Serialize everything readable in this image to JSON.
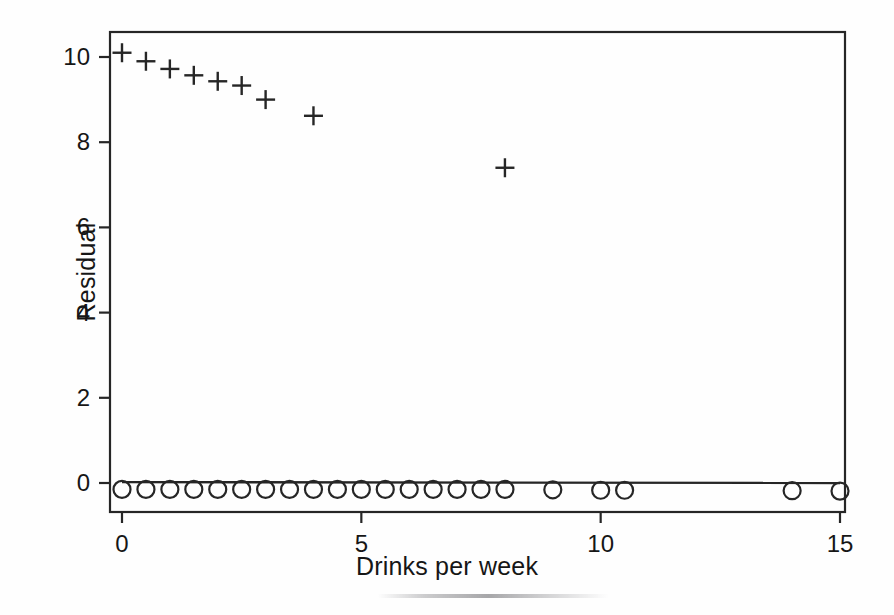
{
  "figure": {
    "background": "#fefefe",
    "ink_color": "#1a1a1a"
  },
  "axes": {
    "x_title": "Drinks per week",
    "y_title": "Residual",
    "x_ticks": [
      "0",
      "5",
      "10",
      "15"
    ],
    "y_ticks": [
      "0",
      "2",
      "4",
      "6",
      "8",
      "10"
    ]
  },
  "chart_data": {
    "type": "scatter",
    "title": "",
    "xlabel": "Drinks per week",
    "ylabel": "Residual",
    "xlim": [
      -0.25,
      15.5
    ],
    "ylim": [
      -0.8,
      10.6
    ],
    "xticks": [
      0,
      5,
      10,
      15
    ],
    "yticks": [
      0,
      2,
      4,
      6,
      8,
      10
    ],
    "grid": false,
    "legend": "none",
    "series": [
      {
        "name": "plus-series",
        "marker": "plus",
        "color": "#262626",
        "points": [
          {
            "x": 0.0,
            "y": 10.1
          },
          {
            "x": 0.5,
            "y": 9.9
          },
          {
            "x": 1.0,
            "y": 9.72
          },
          {
            "x": 1.5,
            "y": 9.57
          },
          {
            "x": 2.0,
            "y": 9.43
          },
          {
            "x": 2.5,
            "y": 9.33
          },
          {
            "x": 3.0,
            "y": 9.0
          },
          {
            "x": 4.0,
            "y": 8.62
          },
          {
            "x": 8.0,
            "y": 7.4
          }
        ]
      },
      {
        "name": "circle-series",
        "marker": "circle",
        "color": "#262626",
        "points": [
          {
            "x": 0.0,
            "y": -0.15
          },
          {
            "x": 0.5,
            "y": -0.15
          },
          {
            "x": 1.0,
            "y": -0.15
          },
          {
            "x": 1.5,
            "y": -0.15
          },
          {
            "x": 2.0,
            "y": -0.15
          },
          {
            "x": 2.5,
            "y": -0.15
          },
          {
            "x": 3.0,
            "y": -0.15
          },
          {
            "x": 3.5,
            "y": -0.15
          },
          {
            "x": 4.0,
            "y": -0.15
          },
          {
            "x": 4.5,
            "y": -0.15
          },
          {
            "x": 5.0,
            "y": -0.15
          },
          {
            "x": 5.5,
            "y": -0.15
          },
          {
            "x": 6.0,
            "y": -0.15
          },
          {
            "x": 6.5,
            "y": -0.15
          },
          {
            "x": 7.0,
            "y": -0.15
          },
          {
            "x": 7.5,
            "y": -0.15
          },
          {
            "x": 8.0,
            "y": -0.15
          },
          {
            "x": 9.0,
            "y": -0.16
          },
          {
            "x": 10.0,
            "y": -0.17
          },
          {
            "x": 10.5,
            "y": -0.17
          },
          {
            "x": 14.0,
            "y": -0.18
          },
          {
            "x": 15.0,
            "y": -0.19
          }
        ]
      }
    ],
    "reference_line": {
      "name": "zero-line",
      "y_start": 0.02,
      "y_end": 0.0,
      "x_start": 0.0,
      "x_end": 15.0
    }
  }
}
